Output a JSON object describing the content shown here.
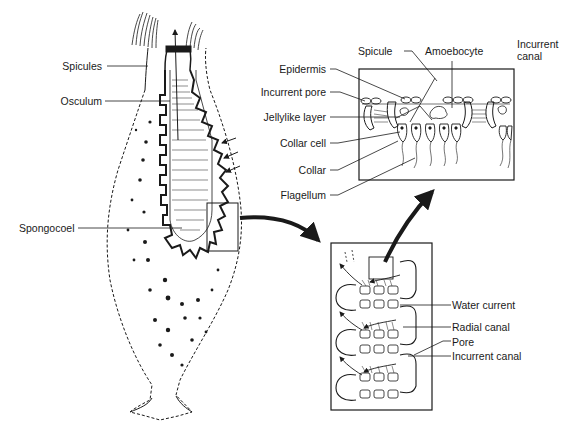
{
  "diagram": {
    "sponge_labels": {
      "spicules": "Spicules",
      "osculum": "Osculum",
      "spongocoel": "Spongocoel"
    },
    "cell_detail_labels": {
      "spicule": "Spicule",
      "amoebocyte": "Amoebocyte",
      "incurrent_canal_line1": "Incurrent",
      "incurrent_canal_line2": "canal",
      "epidermis": "Epidermis",
      "incurrent_pore": "Incurrent pore",
      "jellylike_layer": "Jellylike layer",
      "collar_cell": "Collar cell",
      "collar": "Collar",
      "flagellum": "Flagellum"
    },
    "canal_detail_labels": {
      "water_current": "Water current",
      "radial_canal": "Radial canal",
      "pore": "Pore",
      "incurrent_canal": "Incurrent canal"
    },
    "colors": {
      "ink": "#1a1a1a",
      "background": "#ffffff"
    }
  }
}
